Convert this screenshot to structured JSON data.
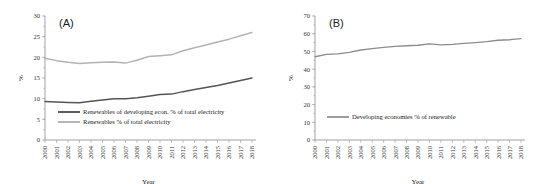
{
  "figure": {
    "panels": [
      {
        "tag": "(A)",
        "xlabel": "Year",
        "ylabel": "%",
        "yticks": [
          "0",
          "5",
          "10",
          "15",
          "20",
          "25",
          "30"
        ],
        "legend": [
          {
            "label": "Renewables of developing econ. % of total electricity",
            "color": "#555555"
          },
          {
            "label": "Renewables % of total electricity",
            "color": "#b3b3b3"
          }
        ]
      },
      {
        "tag": "(B)",
        "xlabel": "Year",
        "ylabel": "%",
        "yticks": [
          "0",
          "10",
          "20",
          "30",
          "40",
          "50",
          "60",
          "70"
        ],
        "legend": [
          {
            "label": "Developing economies % of renewable",
            "color": "#8c8c8c"
          }
        ]
      }
    ],
    "xticks": [
      "2000",
      "2001",
      "2002",
      "2003",
      "2004",
      "2005",
      "2006",
      "2007",
      "2008",
      "2009",
      "2010",
      "2011",
      "2012",
      "2013",
      "2014",
      "2015",
      "2016",
      "2017",
      "2018"
    ]
  },
  "chart_data": [
    {
      "type": "line",
      "title": "(A)",
      "xlabel": "Year",
      "ylabel": "%",
      "ylim": [
        0,
        30
      ],
      "grid": false,
      "legend_position": "lower-center",
      "x": [
        "2000",
        "2001",
        "2002",
        "2003",
        "2004",
        "2005",
        "2006",
        "2007",
        "2008",
        "2009",
        "2010",
        "2011",
        "2012",
        "2013",
        "2014",
        "2015",
        "2016",
        "2017",
        "2018"
      ],
      "series": [
        {
          "name": "Renewables of developing econ. % of total electricity",
          "color": "#555555",
          "values": [
            9.3,
            9.2,
            9.1,
            9.0,
            9.4,
            9.7,
            10.0,
            10.0,
            10.2,
            10.6,
            11.0,
            11.1,
            11.7,
            12.2,
            12.7,
            13.2,
            13.8,
            14.4,
            15.0
          ]
        },
        {
          "name": "Renewables % of total electricity",
          "color": "#b3b3b3",
          "values": [
            19.8,
            19.2,
            18.8,
            18.5,
            18.7,
            18.8,
            18.9,
            18.6,
            19.3,
            20.2,
            20.4,
            20.6,
            21.6,
            22.3,
            23.0,
            23.7,
            24.4,
            25.2,
            26.0
          ]
        }
      ]
    },
    {
      "type": "line",
      "title": "(B)",
      "xlabel": "Year",
      "ylabel": "%",
      "ylim": [
        0,
        70
      ],
      "grid": false,
      "legend_position": "lower-center",
      "x": [
        "2000",
        "2001",
        "2002",
        "2003",
        "2004",
        "2005",
        "2006",
        "2007",
        "2008",
        "2009",
        "2010",
        "2011",
        "2012",
        "2013",
        "2014",
        "2015",
        "2016",
        "2017",
        "2018"
      ],
      "series": [
        {
          "name": "Developing economies % of renewable",
          "color": "#8c8c8c",
          "values": [
            47.0,
            48.3,
            48.6,
            49.5,
            50.8,
            51.6,
            52.3,
            52.9,
            53.2,
            53.5,
            54.3,
            53.7,
            54.0,
            54.5,
            55.0,
            55.5,
            56.3,
            56.6,
            57.2
          ]
        }
      ]
    }
  ]
}
